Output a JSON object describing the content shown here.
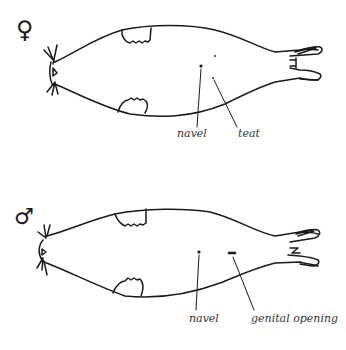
{
  "figures": [
    {
      "name": "female",
      "sex_symbol": "♀",
      "labels": {
        "navel": "navel",
        "teat": "teat"
      }
    },
    {
      "name": "male",
      "sex_symbol": "♂",
      "labels": {
        "navel": "navel",
        "genital": "genital opening"
      }
    }
  ],
  "colors": {
    "ink": "#1a1a1a",
    "background": "#ffffff"
  }
}
